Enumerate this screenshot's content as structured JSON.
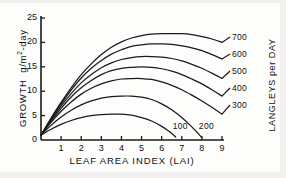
{
  "chart_data": {
    "type": "line",
    "title": "",
    "xlabel": "LEAF AREA INDEX (LAI)",
    "ylabel": "GROWTH  g/m2-day",
    "ylabel_parts": {
      "name": "GROWTH",
      "units_pre": "g/m",
      "units_sup": "2",
      "units_post": "-day"
    },
    "secondary_ylabel": "LANGLEYS per DAY",
    "xlim": [
      0,
      9
    ],
    "ylim": [
      0,
      25
    ],
    "xticks": [
      1,
      2,
      3,
      4,
      5,
      6,
      7,
      8,
      9
    ],
    "xtick_labels": [
      "1",
      "2",
      "3",
      "4",
      "5",
      "6",
      "7",
      "8",
      "9"
    ],
    "yticks": [
      0,
      5,
      10,
      15,
      20,
      25
    ],
    "ytick_labels": [
      "0",
      "5",
      "10",
      "15",
      "20",
      "25"
    ],
    "grid": false,
    "legend_position": "inline-right",
    "legend_title": "LANGLEYS per DAY",
    "line_color": "#1a1a1a",
    "axis_color": "#1a1a1a",
    "background": "#fdfdfc",
    "series": [
      {
        "name": "100",
        "label": "100",
        "label_position": "inline",
        "peak_x": 4.0,
        "peak_y": 5.3,
        "x_end": 6.7,
        "x": [
          0,
          0.5,
          1.0,
          1.5,
          2.0,
          2.5,
          3.0,
          3.5,
          4.0,
          4.5,
          5.0,
          5.5,
          6.0,
          6.4,
          6.7
        ],
        "values": [
          1.0,
          2.2,
          3.2,
          4.0,
          4.6,
          5.0,
          5.2,
          5.3,
          5.3,
          5.1,
          4.6,
          3.9,
          2.8,
          1.7,
          0.6
        ]
      },
      {
        "name": "200",
        "label": "200",
        "label_position": "inline",
        "peak_x": 4.7,
        "peak_y": 9.0,
        "x_end": 8.0,
        "x": [
          0,
          0.5,
          1.0,
          1.5,
          2.0,
          2.5,
          3.0,
          3.5,
          4.0,
          4.5,
          5.0,
          5.5,
          6.0,
          6.5,
          7.0,
          7.5,
          8.0
        ],
        "values": [
          1.0,
          3.0,
          4.7,
          6.1,
          7.2,
          8.0,
          8.6,
          8.9,
          9.0,
          9.0,
          8.8,
          8.3,
          7.4,
          6.2,
          4.6,
          2.7,
          0.5
        ]
      },
      {
        "name": "300",
        "label": "300",
        "label_position": "right",
        "peak_x": 5.2,
        "peak_y": 12.6,
        "x_end": 9.0,
        "x": [
          0,
          0.5,
          1.0,
          1.5,
          2.0,
          2.5,
          3.0,
          3.5,
          4.0,
          4.5,
          5.0,
          5.5,
          6.0,
          6.5,
          7.0,
          7.5,
          8.0,
          8.5,
          9.0
        ],
        "values": [
          1.0,
          3.6,
          5.9,
          7.8,
          9.4,
          10.6,
          11.5,
          12.1,
          12.5,
          12.6,
          12.6,
          12.4,
          11.9,
          11.2,
          10.3,
          9.2,
          8.0,
          6.7,
          5.3
        ]
      },
      {
        "name": "400",
        "label": "400",
        "label_position": "right",
        "peak_x": 5.7,
        "peak_y": 15.0,
        "x_end": 9.0,
        "x": [
          0,
          0.5,
          1.0,
          1.5,
          2.0,
          2.5,
          3.0,
          3.5,
          4.0,
          4.5,
          5.0,
          5.5,
          6.0,
          6.5,
          7.0,
          7.5,
          8.0,
          8.5,
          9.0
        ],
        "values": [
          1.0,
          3.9,
          6.5,
          8.8,
          10.7,
          12.2,
          13.4,
          14.2,
          14.7,
          14.9,
          15.0,
          14.9,
          14.6,
          14.1,
          13.4,
          12.5,
          11.5,
          10.3,
          9.0
        ]
      },
      {
        "name": "500",
        "label": "500",
        "label_position": "right",
        "peak_x": 6.2,
        "peak_y": 17.1,
        "x_end": 9.0,
        "x": [
          0,
          0.5,
          1.0,
          1.5,
          2.0,
          2.5,
          3.0,
          3.5,
          4.0,
          4.5,
          5.0,
          5.5,
          6.0,
          6.5,
          7.0,
          7.5,
          8.0,
          8.5,
          9.0
        ],
        "values": [
          1.0,
          4.1,
          7.0,
          9.5,
          11.7,
          13.4,
          14.8,
          15.8,
          16.5,
          16.9,
          17.1,
          17.1,
          17.0,
          16.7,
          16.2,
          15.5,
          14.7,
          13.7,
          12.6
        ]
      },
      {
        "name": "600",
        "label": "600",
        "label_position": "right",
        "peak_x": 6.6,
        "peak_y": 19.7,
        "x_end": 9.0,
        "x": [
          0,
          0.5,
          1.0,
          1.5,
          2.0,
          2.5,
          3.0,
          3.5,
          4.0,
          4.5,
          5.0,
          5.5,
          6.0,
          6.5,
          7.0,
          7.5,
          8.0,
          8.5,
          9.0
        ],
        "values": [
          1.0,
          4.3,
          7.4,
          10.2,
          12.7,
          14.7,
          16.3,
          17.6,
          18.5,
          19.2,
          19.5,
          19.7,
          19.7,
          19.6,
          19.3,
          18.9,
          18.3,
          17.5,
          16.6
        ]
      },
      {
        "name": "700",
        "label": "700",
        "label_position": "right",
        "peak_x": 7.0,
        "peak_y": 21.8,
        "x_end": 9.0,
        "x": [
          0,
          0.5,
          1.0,
          1.5,
          2.0,
          2.5,
          3.0,
          3.5,
          4.0,
          4.5,
          5.0,
          5.5,
          6.0,
          6.5,
          7.0,
          7.5,
          8.0,
          8.5,
          9.0
        ],
        "values": [
          1.0,
          4.5,
          7.7,
          10.7,
          13.4,
          15.6,
          17.5,
          19.0,
          20.1,
          20.9,
          21.4,
          21.7,
          21.8,
          21.8,
          21.8,
          21.6,
          21.2,
          20.7,
          20.0
        ]
      }
    ]
  }
}
